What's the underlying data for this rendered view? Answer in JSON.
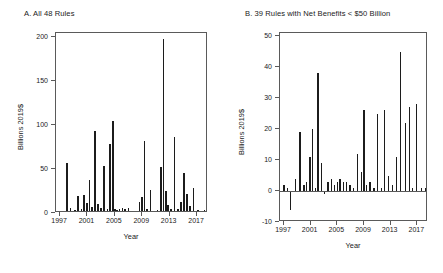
{
  "figure": {
    "axis_title_x": "Year",
    "axis_title_y": "Billions 2019$"
  },
  "panel_a": {
    "title": "A. All 48 Rules",
    "ytitle": "Billions 2019$",
    "xtitle": "Year",
    "yticks": [
      "0",
      "50",
      "100",
      "150",
      "200"
    ],
    "xticks": [
      "1997",
      "2001",
      "2005",
      "2009",
      "2013",
      "2017"
    ]
  },
  "panel_b": {
    "title": "B. 39 Rules with Net Benefits < $50 Billion",
    "ytitle": "Billions 2019$",
    "xtitle": "Year",
    "yticks": [
      "-10",
      "0",
      "10",
      "20",
      "30",
      "40",
      "50"
    ],
    "xticks": [
      "1997",
      "2001",
      "2005",
      "2009",
      "2013",
      "2017"
    ]
  },
  "chart_data": [
    {
      "type": "bar",
      "panel": "A",
      "title": "A. All 48 Rules",
      "xlabel": "Year",
      "ylabel": "Billions 2019$",
      "xlim": [
        1996.4,
        2018.6
      ],
      "ylim": [
        0,
        205
      ],
      "xtick_values": [
        1997,
        2001,
        2005,
        2009,
        2013,
        2017
      ],
      "ytick_values": [
        0,
        50,
        100,
        150,
        200
      ],
      "grid": false,
      "legend": "none",
      "bar_color": "#1c1c1c",
      "x": [
        1997.0,
        1997.5,
        1998.0,
        1998.5,
        1999.2,
        1999.6,
        2000.1,
        2000.5,
        2000.9,
        2001.3,
        2001.7,
        2002.1,
        2002.5,
        2003.0,
        2003.4,
        2003.9,
        2004.3,
        2004.7,
        2005.0,
        2005.3,
        2005.7,
        2006.1,
        2006.5,
        2007.0,
        2007.5,
        2008.0,
        2008.6,
        2009.0,
        2009.3,
        2009.7,
        2010.2,
        2010.7,
        2011.2,
        2011.7,
        2012.1,
        2012.5,
        2012.8,
        2013.2,
        2013.7,
        2014.2,
        2014.7,
        2015.1,
        2015.5,
        2016.0,
        2016.5,
        2017.1,
        2017.6,
        2018.1
      ],
      "values": [
        2,
        1,
        57,
        6,
        3,
        19,
        5,
        20,
        11,
        38,
        7,
        93,
        10,
        6,
        53,
        5,
        79,
        105,
        4,
        3,
        5,
        6,
        4,
        6,
        2,
        1,
        12,
        18,
        82,
        4,
        26,
        2,
        3,
        52,
        198,
        25,
        9,
        5,
        87,
        4,
        12,
        46,
        22,
        8,
        28,
        3,
        2,
        3
      ]
    },
    {
      "type": "bar",
      "panel": "B",
      "title": "B. 39 Rules with Net Benefits < $50 Billion",
      "xlabel": "Year",
      "ylabel": "Billions 2019$",
      "xlim": [
        1996.4,
        2018.6
      ],
      "ylim": [
        -10,
        51
      ],
      "xtick_values": [
        1997,
        2001,
        2005,
        2009,
        2013,
        2017
      ],
      "ytick_values": [
        -10,
        0,
        10,
        20,
        30,
        40,
        50
      ],
      "grid": false,
      "legend": "none",
      "bar_color": "#1c1c1c",
      "x": [
        1997.0,
        1997.5,
        1998.0,
        1998.7,
        1999.4,
        2000.0,
        2000.4,
        2000.9,
        2001.3,
        2001.7,
        2002.1,
        2002.6,
        2003.1,
        2003.6,
        2004.1,
        2004.6,
        2005.0,
        2005.4,
        2005.9,
        2006.4,
        2006.9,
        2007.4,
        2008.0,
        2008.6,
        2009.0,
        2009.4,
        2009.9,
        2010.5,
        2011.0,
        2011.6,
        2012.1,
        2012.7,
        2013.3,
        2013.9,
        2014.5,
        2015.2,
        2015.8,
        2016.3,
        2016.9,
        2017.6,
        2018.2
      ],
      "values": [
        2,
        1,
        -6,
        4,
        19,
        2,
        3,
        11,
        20,
        1,
        38,
        9,
        -1,
        3,
        4,
        2,
        3,
        4,
        3,
        3,
        2,
        1,
        12,
        6,
        26,
        2,
        3,
        1,
        25,
        1,
        26,
        5,
        2,
        11,
        45,
        22,
        27,
        1,
        28,
        1,
        1
      ]
    }
  ]
}
